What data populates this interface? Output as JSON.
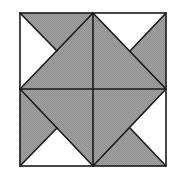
{
  "diagram": {
    "type": "quilt-block-pinwheel",
    "colors": {
      "shaded": "#9a9a9a",
      "white": "#ffffff",
      "stroke": "#1a1a1a"
    },
    "square": {
      "x0": 20,
      "y0": 13,
      "x1": 166,
      "y1": 166,
      "cx": 93,
      "cy": 89
    },
    "white_triangles": [
      {
        "quadrant": "top-left",
        "points": "20,13 20,89 57,51"
      },
      {
        "quadrant": "top-right",
        "points": "93,13 166,13 130,51"
      },
      {
        "quadrant": "bottom-right",
        "points": "166,89 166,166 130,128"
      },
      {
        "quadrant": "bottom-left",
        "points": "20,166 93,166 57,128"
      }
    ],
    "lines": [
      {
        "name": "tl-long-diagonal",
        "x1": 20,
        "y1": 89,
        "x2": 93,
        "y2": 13
      },
      {
        "name": "tl-short-diagonal",
        "x1": 20,
        "y1": 13,
        "x2": 57,
        "y2": 51
      },
      {
        "name": "tr-long-diagonal",
        "x1": 93,
        "y1": 13,
        "x2": 166,
        "y2": 89
      },
      {
        "name": "tr-short-diagonal",
        "x1": 166,
        "y1": 13,
        "x2": 130,
        "y2": 51
      },
      {
        "name": "br-long-diagonal",
        "x1": 166,
        "y1": 89,
        "x2": 93,
        "y2": 166
      },
      {
        "name": "br-short-diagonal",
        "x1": 166,
        "y1": 166,
        "x2": 130,
        "y2": 128
      },
      {
        "name": "bl-long-diagonal",
        "x1": 93,
        "y1": 166,
        "x2": 20,
        "y2": 89
      },
      {
        "name": "bl-short-diagonal",
        "x1": 20,
        "y1": 166,
        "x2": 57,
        "y2": 128
      }
    ]
  }
}
